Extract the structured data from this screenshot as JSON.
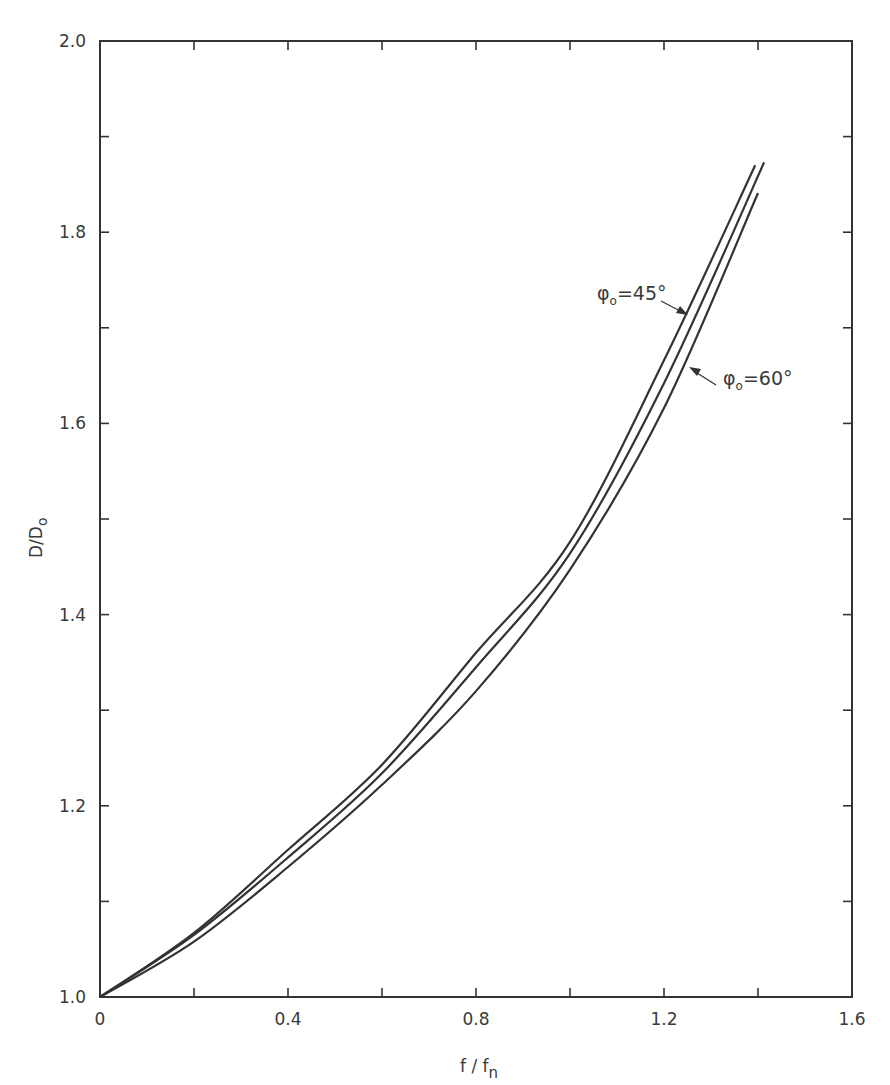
{
  "chart_data": {
    "type": "line",
    "title": "",
    "xlabel": "f/f_n",
    "ylabel": "D/D_0",
    "xlim": [
      0,
      1.6
    ],
    "ylim": [
      1.0,
      2.0
    ],
    "grid": false,
    "x_ticks": [
      0,
      0.2,
      0.4,
      0.6,
      0.8,
      1.0,
      1.2,
      1.4,
      1.6
    ],
    "x_tick_labels": [
      "0",
      "0.4",
      "0.8",
      "1.2",
      "1.6"
    ],
    "x_tick_label_values": [
      0,
      0.4,
      0.8,
      1.2,
      1.6
    ],
    "y_ticks": [
      1.0,
      1.1,
      1.2,
      1.3,
      1.4,
      1.5,
      1.6,
      1.7,
      1.8,
      1.9,
      2.0
    ],
    "y_tick_labels": [
      "1.0",
      "1.2",
      "1.4",
      "1.6",
      "1.8",
      "2.0"
    ],
    "y_tick_label_values": [
      1.0,
      1.2,
      1.4,
      1.6,
      1.8,
      2.0
    ],
    "series": [
      {
        "name": "φ0 = 45°",
        "x": [
          0,
          0.2,
          0.4,
          0.6,
          0.8,
          1.0,
          1.2,
          1.394
        ],
        "y": [
          1.0,
          1.067,
          1.154,
          1.243,
          1.36,
          1.476,
          1.666,
          1.87
        ]
      },
      {
        "name": "(unlabeled middle curve)",
        "x": [
          0,
          0.2,
          0.4,
          0.6,
          0.8,
          1.0,
          1.2,
          1.413
        ],
        "y": [
          1.0,
          1.065,
          1.146,
          1.234,
          1.345,
          1.464,
          1.642,
          1.873
        ]
      },
      {
        "name": "φ0 = 60°",
        "x": [
          0,
          0.2,
          0.4,
          0.6,
          0.8,
          1.0,
          1.2,
          1.4
        ],
        "y": [
          1.0,
          1.058,
          1.136,
          1.222,
          1.32,
          1.447,
          1.616,
          1.841
        ]
      }
    ],
    "annotations": [
      {
        "text": "φ0=45°",
        "points_to_series": 0
      },
      {
        "text": "φ0=60°",
        "points_to_series": 2
      }
    ]
  },
  "labels": {
    "xlabel_main": "f / f",
    "xlabel_sub": "n",
    "ylabel_main": "D/D",
    "ylabel_sub": "o",
    "annot45_phi": "φ",
    "annot45_sub": "o",
    "annot45_rest": "=45°",
    "annot60_phi": "φ",
    "annot60_sub": "o",
    "annot60_rest": "=60°"
  }
}
